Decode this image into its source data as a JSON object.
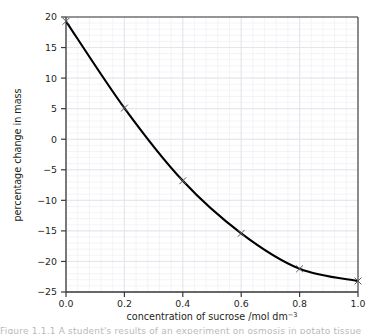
{
  "figure": {
    "background_color": "#ffffff",
    "frame_color": "#3a3a3c",
    "grid_color": "#ececf1",
    "curve_color": "#000000",
    "marker_color": "#58585b",
    "caption_clipped": "Figure 1.1.1 A student's results of an experiment on osmosis in potato tissue"
  },
  "chart_data": {
    "type": "line",
    "title": "",
    "xlabel": "concentration of sucrose /mol dm",
    "xlabel_exponent": "−3",
    "ylabel": "percentage change in mass",
    "x": [
      0.0,
      0.2,
      0.4,
      0.6,
      0.8,
      1.0
    ],
    "y": [
      19.3,
      5.1,
      -6.8,
      -15.4,
      -21.2,
      -23.2
    ],
    "series": [
      {
        "name": "percentage change in mass",
        "x": [
          0.0,
          0.2,
          0.4,
          0.6,
          0.8,
          1.0
        ],
        "values": [
          19.3,
          5.1,
          -6.8,
          -15.4,
          -21.2,
          -23.2
        ]
      }
    ],
    "xlim": [
      0.0,
      1.0
    ],
    "ylim": [
      -25,
      20
    ],
    "xticks": [
      0.0,
      0.2,
      0.4,
      0.6,
      0.8,
      1.0
    ],
    "xtick_labels": [
      "0.0",
      "0.2",
      "0.4",
      "0.6",
      "0.8",
      "1.0"
    ],
    "yticks": [
      20,
      15,
      10,
      5,
      0,
      -5,
      -10,
      -15,
      -20,
      -25
    ],
    "ytick_labels": [
      "20",
      "15",
      "10",
      "5",
      "0",
      "−5",
      "−10",
      "−15",
      "−20",
      "−25"
    ],
    "grid": true,
    "grid_minor": true,
    "legend": false,
    "marker": "x",
    "smooth_curve": true
  }
}
